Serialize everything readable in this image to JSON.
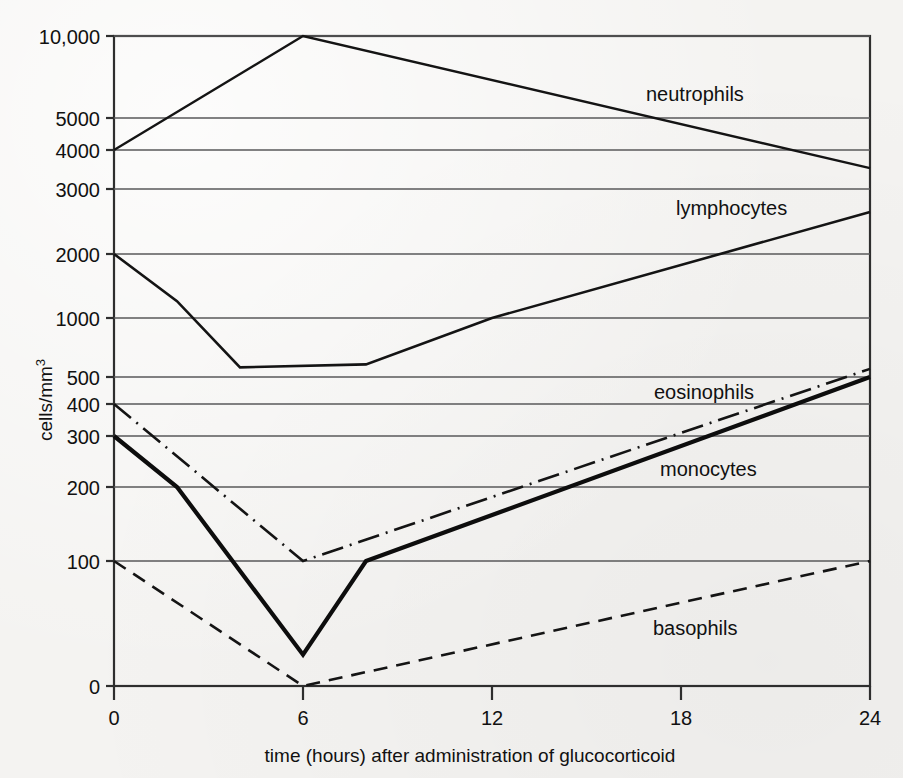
{
  "chart_data": {
    "type": "line",
    "title": "",
    "xlabel": "time (hours) after administration of glucocorticoid",
    "ylabel": "cells/mm3",
    "ylabel_display": "cells/mm",
    "ylabel_superscript": "3",
    "scale": "log-like piecewise (hand-drawn semi-log)",
    "xlim": [
      0,
      24
    ],
    "ylim": [
      0,
      10000
    ],
    "grid": true,
    "legend_position": "inline-right-of-curves",
    "xticks": [
      0,
      6,
      12,
      18,
      24
    ],
    "xtick_labels": [
      "0",
      "6",
      "12",
      "18",
      "24"
    ],
    "yticks": [
      0,
      100,
      200,
      300,
      400,
      500,
      1000,
      2000,
      3000,
      4000,
      5000,
      10000
    ],
    "ytick_labels": [
      "0",
      "100",
      "200",
      "300",
      "400",
      "500",
      "1000",
      "2000",
      "3000",
      "4000",
      "5000",
      "10,000"
    ],
    "series": [
      {
        "name": "neutrophils",
        "style": "solid",
        "x": [
          0,
          6,
          24
        ],
        "values": [
          4000,
          10000,
          3500
        ]
      },
      {
        "name": "lymphocytes",
        "style": "solid",
        "x": [
          0,
          2,
          4,
          8,
          12,
          24
        ],
        "values": [
          2000,
          1200,
          560,
          580,
          1000,
          2600
        ]
      },
      {
        "name": "eosinophils",
        "style": "dash-dot",
        "x": [
          0,
          6,
          24
        ],
        "values": [
          400,
          100,
          550
        ]
      },
      {
        "name": "monocytes",
        "style": "solid-bold",
        "x": [
          0,
          2,
          6,
          8,
          24
        ],
        "values": [
          300,
          200,
          25,
          100,
          500
        ]
      },
      {
        "name": "basophils",
        "style": "dashed",
        "x": [
          0,
          6,
          24
        ],
        "values": [
          100,
          0,
          100
        ]
      }
    ]
  },
  "annotations": {
    "neutrophils_label": "neutrophils",
    "lymphocytes_label": "lymphocytes",
    "eosinophils_label": "eosinophils",
    "monocytes_label": "monocytes",
    "basophils_label": "basophils"
  },
  "colors": {
    "ink": "#111111",
    "grid": "#59595a",
    "frame": "#2e2e2e",
    "paper": "#f4f3f1"
  }
}
